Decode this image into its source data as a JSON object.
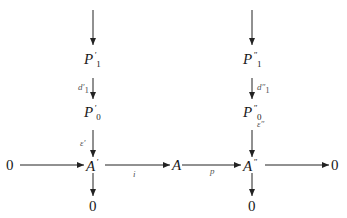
{
  "diagram": {
    "type": "commutative-diagram",
    "nodes": {
      "p1_prime": {
        "base": "P",
        "prime": "′",
        "sub": "1"
      },
      "p0_prime": {
        "base": "P",
        "prime": "′",
        "sub": "0"
      },
      "p1_dprime": {
        "base": "P",
        "prime": "″",
        "sub": "1"
      },
      "p0_dprime": {
        "base": "P",
        "prime": "″",
        "sub": "0"
      },
      "a_prime": {
        "base": "A",
        "prime": "′"
      },
      "a": {
        "base": "A"
      },
      "a_dprime": {
        "base": "A",
        "prime": "″"
      },
      "zero_left": "0",
      "zero_right": "0",
      "zero_bottom_left": "0",
      "zero_bottom_right": "0"
    },
    "edges": {
      "d1_prime": {
        "base": "d",
        "prime": "′",
        "sub": "1"
      },
      "eps_prime": {
        "base": "ε",
        "prime": "′"
      },
      "d1_dprime": {
        "base": "d",
        "prime": "″",
        "sub": "1"
      },
      "eps_dprime": {
        "base": "ε",
        "prime": "″"
      },
      "i": "i",
      "p": "p"
    }
  }
}
